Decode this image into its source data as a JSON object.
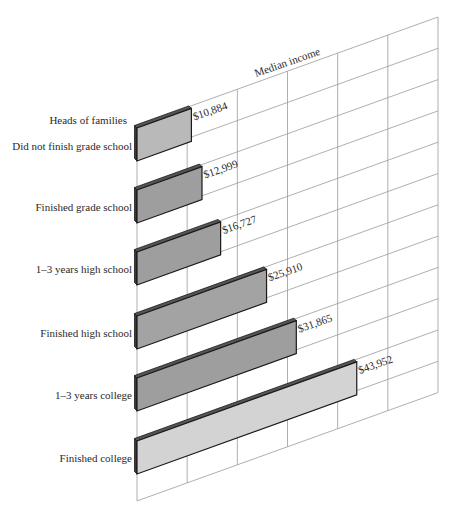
{
  "chart_data": {
    "type": "bar",
    "orientation": "horizontal",
    "style": "skewed-3d",
    "title": "",
    "header_label": "Heads of families",
    "axis_title": "Median income",
    "categories": [
      "Did not finish grade school",
      "Finished grade school",
      "1–3 years high school",
      "Finished high school",
      "1–3 years college",
      "Finished college"
    ],
    "values": [
      10884,
      12999,
      16727,
      25910,
      31865,
      43952
    ],
    "value_labels": [
      "$10,884",
      "$12,999",
      "$16,727",
      "$25,910",
      "$31,865",
      "$43,952"
    ],
    "xlim": [
      0,
      60000
    ],
    "grid": true,
    "grid_columns": 6,
    "grid_rows": 12,
    "bar_colors": [
      "#b9b9b9",
      "#9e9e9e",
      "#9e9e9e",
      "#a3a3a3",
      "#9e9e9e",
      "#d3d3d3"
    ],
    "legend": null
  }
}
